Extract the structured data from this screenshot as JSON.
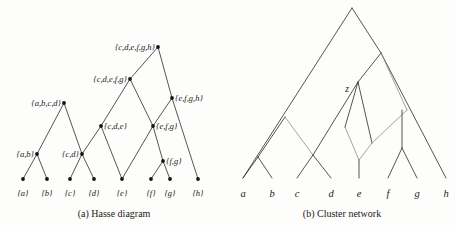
{
  "figure": {
    "background": "#fdfdfc",
    "edge_color": "#2a2a2a",
    "light_edge_color": "#8c8c8c",
    "node_color": "#141414"
  },
  "panel_a": {
    "caption": "(a) Hasse diagram",
    "nodes": [
      {
        "id": "top",
        "label": "{c,d,e,f,g,h}",
        "x": 158,
        "y": 47,
        "anchor": "end",
        "lx": 155,
        "ly": 50
      },
      {
        "id": "cdefg",
        "label": "{c,d,e,f,g}",
        "x": 130,
        "y": 79,
        "anchor": "end",
        "lx": 127,
        "ly": 82
      },
      {
        "id": "abcd",
        "label": "{a,b,c,d}",
        "x": 64,
        "y": 103,
        "anchor": "end",
        "lx": 61,
        "ly": 106
      },
      {
        "id": "efgh",
        "label": "{e,f,g,h}",
        "x": 172,
        "y": 98,
        "anchor": "start",
        "lx": 175,
        "ly": 101
      },
      {
        "id": "cde",
        "label": "{c,d,e}",
        "x": 101,
        "y": 126,
        "anchor": "start",
        "lx": 104,
        "ly": 129
      },
      {
        "id": "efg",
        "label": "{e,f,g}",
        "x": 153,
        "y": 126,
        "anchor": "start",
        "lx": 156,
        "ly": 129
      },
      {
        "id": "ab",
        "label": "{a,b}",
        "x": 37,
        "y": 154,
        "anchor": "end",
        "lx": 34,
        "ly": 157
      },
      {
        "id": "cd",
        "label": "{c,d}",
        "x": 82,
        "y": 154,
        "anchor": "end",
        "lx": 79,
        "ly": 157
      },
      {
        "id": "fg",
        "label": "{f,g}",
        "x": 163,
        "y": 161,
        "anchor": "start",
        "lx": 166,
        "ly": 164
      },
      {
        "id": "a",
        "label": "{a}",
        "x": 23,
        "y": 179,
        "anchor": "middle",
        "lx": 23,
        "ly": 196
      },
      {
        "id": "b",
        "label": "{b}",
        "x": 47,
        "y": 179,
        "anchor": "middle",
        "lx": 47,
        "ly": 196
      },
      {
        "id": "c",
        "label": "{c}",
        "x": 70,
        "y": 179,
        "anchor": "middle",
        "lx": 70,
        "ly": 196
      },
      {
        "id": "d",
        "label": "{d}",
        "x": 94,
        "y": 179,
        "anchor": "middle",
        "lx": 94,
        "ly": 196
      },
      {
        "id": "e",
        "label": "{e}",
        "x": 122,
        "y": 179,
        "anchor": "middle",
        "lx": 122,
        "ly": 196
      },
      {
        "id": "f",
        "label": "{f}",
        "x": 151,
        "y": 179,
        "anchor": "middle",
        "lx": 151,
        "ly": 196
      },
      {
        "id": "g",
        "label": "{g}",
        "x": 170,
        "y": 179,
        "anchor": "middle",
        "lx": 170,
        "ly": 196
      },
      {
        "id": "h",
        "label": "{h}",
        "x": 198,
        "y": 179,
        "anchor": "middle",
        "lx": 198,
        "ly": 196
      }
    ],
    "edges": [
      [
        "top",
        "cdefg"
      ],
      [
        "top",
        "efgh"
      ],
      [
        "cdefg",
        "cde"
      ],
      [
        "cdefg",
        "efg"
      ],
      [
        "efgh",
        "efg"
      ],
      [
        "efgh",
        "h"
      ],
      [
        "abcd",
        "ab"
      ],
      [
        "abcd",
        "cd"
      ],
      [
        "cde",
        "cd"
      ],
      [
        "cde",
        "e"
      ],
      [
        "efg",
        "e"
      ],
      [
        "efg",
        "fg"
      ],
      [
        "ab",
        "a"
      ],
      [
        "ab",
        "b"
      ],
      [
        "cd",
        "c"
      ],
      [
        "cd",
        "d"
      ],
      [
        "fg",
        "f"
      ],
      [
        "fg",
        "g"
      ]
    ]
  },
  "panel_b": {
    "caption": "(b) Cluster network",
    "internal_label": "z",
    "internal_label_pos": {
      "x": 349,
      "y": 92
    },
    "leaves": [
      {
        "id": "a",
        "label": "a",
        "x": 243,
        "y": 197,
        "tip_x": 243,
        "tip_y": 178
      },
      {
        "id": "b",
        "label": "b",
        "x": 272,
        "y": 197,
        "tip_x": 272,
        "tip_y": 178
      },
      {
        "id": "c",
        "label": "c",
        "x": 297,
        "y": 197,
        "tip_x": 297,
        "tip_y": 178
      },
      {
        "id": "d",
        "label": "d",
        "x": 331,
        "y": 197,
        "tip_x": 331,
        "tip_y": 178
      },
      {
        "id": "e",
        "label": "e",
        "x": 359,
        "y": 197,
        "tip_x": 359,
        "tip_y": 178
      },
      {
        "id": "f",
        "label": "f",
        "x": 388,
        "y": 197,
        "tip_x": 388,
        "tip_y": 178
      },
      {
        "id": "g",
        "label": "g",
        "x": 417,
        "y": 197,
        "tip_x": 417,
        "tip_y": 178
      },
      {
        "id": "h",
        "label": "h",
        "x": 446,
        "y": 197,
        "tip_x": 446,
        "tip_y": 178
      }
    ],
    "internal_nodes": [
      {
        "id": "root",
        "x": 352,
        "y": 8
      },
      {
        "id": "n_efgh",
        "x": 381,
        "y": 53
      },
      {
        "id": "n_abcd",
        "x": 285,
        "y": 117
      },
      {
        "id": "z",
        "x": 358,
        "y": 82
      },
      {
        "id": "n_ab",
        "x": 258,
        "y": 157
      },
      {
        "id": "n_cd",
        "x": 313,
        "y": 155
      },
      {
        "id": "n_fgr",
        "x": 407,
        "y": 110
      },
      {
        "id": "n_fg",
        "x": 402,
        "y": 148
      },
      {
        "id": "n_retic_e",
        "x": 372,
        "y": 143
      },
      {
        "id": "n_ecross",
        "x": 345,
        "y": 127
      }
    ]
  }
}
